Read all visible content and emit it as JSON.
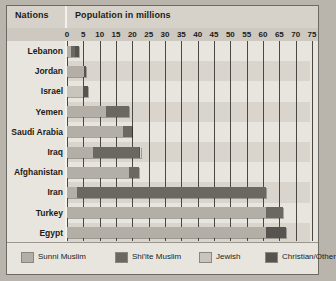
{
  "header": {
    "nations_label": "Nations",
    "population_label": "Population in millions"
  },
  "chart_data": {
    "type": "bar",
    "orientation": "horizontal",
    "stacked": true,
    "title": "Population in millions",
    "xlabel": "Population in millions",
    "ylabel": "Nations",
    "xlim": [
      0,
      75
    ],
    "grid": true,
    "legend_position": "bottom",
    "tick_labels": [
      "0",
      "5",
      "10",
      "15",
      "20",
      "25",
      "30",
      "35",
      "40",
      "45",
      "50",
      "55",
      "60",
      "65",
      "70",
      "75"
    ],
    "ticks": [
      0,
      5,
      10,
      15,
      20,
      25,
      30,
      35,
      40,
      45,
      50,
      55,
      60,
      65,
      70,
      75
    ],
    "categories": [
      "Lebanon",
      "Jordan",
      "Israel",
      "Yemen",
      "Saudi Arabia",
      "Iraq",
      "Afghanistan",
      "Iran",
      "Turkey",
      "Egypt"
    ],
    "series": [
      {
        "name": "Sunni Muslim",
        "color": "#b3afa6",
        "values": [
          1.2,
          5.2,
          0.0,
          12.0,
          17.0,
          8.0,
          19.0,
          3.0,
          61.0,
          61.0
        ]
      },
      {
        "name": "Shi'ite Muslim",
        "color": "#6b6862",
        "values": [
          1.3,
          0.0,
          0.0,
          7.0,
          3.0,
          14.0,
          3.0,
          58.0,
          5.0,
          0.0
        ]
      },
      {
        "name": "Jewish",
        "color": "#c9c5bc",
        "values": [
          0.0,
          0.0,
          5.0,
          0.0,
          0.0,
          0.0,
          0.0,
          0.0,
          0.0,
          0.0
        ]
      },
      {
        "name": "Christian/Other",
        "color": "#57544f",
        "values": [
          1.1,
          0.6,
          1.4,
          0.0,
          0.0,
          0.5,
          0.0,
          0.0,
          0.0,
          6.0
        ]
      }
    ],
    "totals": [
      3.6,
      5.8,
      6.4,
      19.0,
      20.0,
      22.5,
      22.0,
      61.0,
      66.0,
      67.0
    ]
  },
  "legend": {
    "items": [
      {
        "label": "Sunni Muslim"
      },
      {
        "label": "Shi'ite Muslim"
      },
      {
        "label": "Jewish"
      },
      {
        "label": "Christian/Other"
      }
    ]
  }
}
